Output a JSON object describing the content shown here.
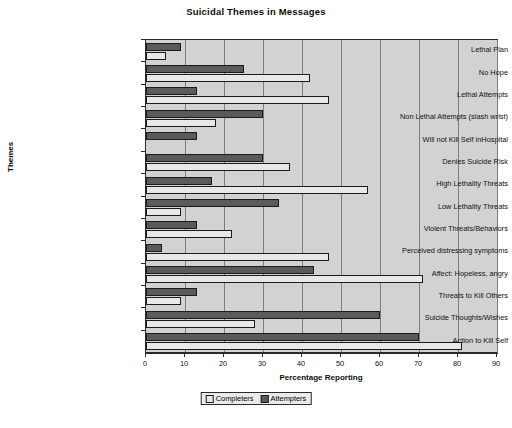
{
  "chart_data": {
    "type": "bar",
    "orientation": "horizontal",
    "title": "Suicidal Themes in Messages",
    "xlabel": "Percentage Reporting",
    "ylabel": "Themes",
    "xlim": [
      0,
      90
    ],
    "xticks": [
      0,
      10,
      20,
      30,
      40,
      50,
      60,
      70,
      80,
      90
    ],
    "grid": true,
    "grid_axis": "x",
    "legend_position": "bottom-center",
    "categories": [
      "Lethal Plan",
      "No Hope",
      "Lethal Attempts",
      "Non Lethal Attempts (slash wrist)",
      "Will not Kill Self inHospital",
      "Denies Suicide Risk",
      "High Lethality Threats",
      "Low Lethality Threats",
      "Violent Threats/Behaviors",
      "Perceived distressing symptoms",
      "Affect: Hopeless, angry",
      "Threats to Kill Others",
      "Suicide Thoughts/Wishes",
      "Action to Kill Self"
    ],
    "series": [
      {
        "name": "Completers",
        "color": "#e8e8e8",
        "values": [
          5,
          42,
          47,
          18,
          0,
          37,
          57,
          9,
          22,
          47,
          71,
          9,
          28,
          81
        ]
      },
      {
        "name": "Attempters",
        "color": "#5a5a5a",
        "values": [
          9,
          25,
          13,
          30,
          13,
          30,
          17,
          34,
          13,
          4,
          43,
          13,
          60,
          70
        ]
      }
    ]
  },
  "legend": {
    "items": [
      {
        "label": "Completers"
      },
      {
        "label": "Attempters"
      }
    ]
  },
  "colors": {
    "plot_background": "#d2d2d2",
    "axis": "#2b2b2b",
    "gridline": "#7d7d7d",
    "completers": "#e8e8e8",
    "attempters": "#5a5a5a"
  }
}
